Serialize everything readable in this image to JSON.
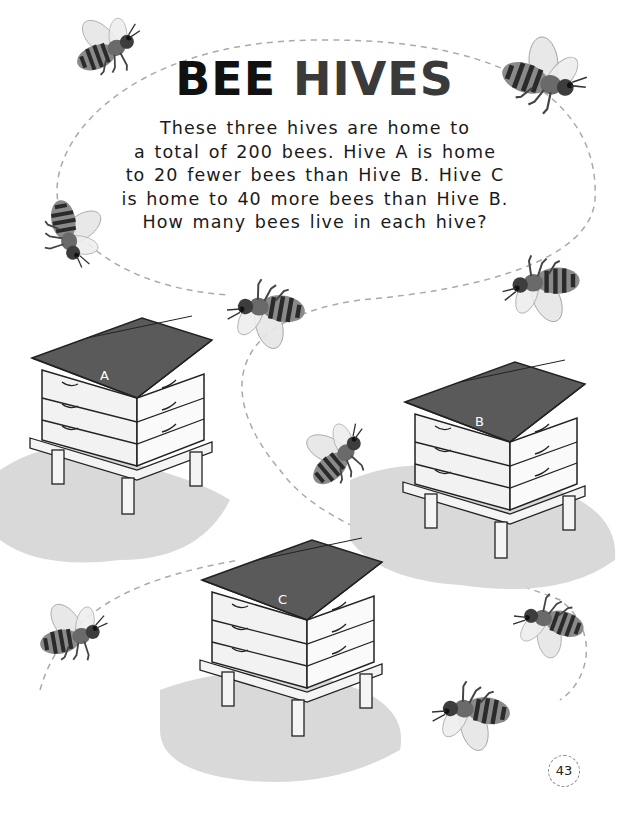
{
  "title": {
    "part1": "BEE",
    "part2": "HIVES"
  },
  "puzzle_text": {
    "lines": [
      "These three hives are home to",
      "a total of 200 bees. Hive A is home",
      "to 20 fewer bees than Hive B. Hive C",
      "is home to 40 more bees than Hive B.",
      "How many bees live in each hive?"
    ]
  },
  "hives": [
    {
      "label": "A"
    },
    {
      "label": "B"
    },
    {
      "label": "C"
    }
  ],
  "page_number": "43",
  "colors": {
    "roof": "#555555",
    "grass": "#d9d9d9",
    "bee_body": "#6a6a6a",
    "path": "#aaaaaa"
  }
}
